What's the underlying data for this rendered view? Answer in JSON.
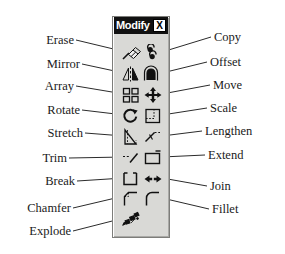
{
  "panel": {
    "title": "Modify",
    "close_label": "X",
    "background_color": "#d9d9d6",
    "titlebar_color": "#111111"
  },
  "tools": [
    {
      "row": 0,
      "col": "left",
      "label": "Erase",
      "icon": "eraser-icon"
    },
    {
      "row": 0,
      "col": "right",
      "label": "Copy",
      "icon": "copy-icon"
    },
    {
      "row": 1,
      "col": "left",
      "label": "Mirror",
      "icon": "mirror-icon"
    },
    {
      "row": 1,
      "col": "right",
      "label": "Offset",
      "icon": "offset-icon"
    },
    {
      "row": 2,
      "col": "left",
      "label": "Array",
      "icon": "array-icon"
    },
    {
      "row": 2,
      "col": "right",
      "label": "Move",
      "icon": "move-icon"
    },
    {
      "row": 3,
      "col": "left",
      "label": "Rotate",
      "icon": "rotate-icon"
    },
    {
      "row": 3,
      "col": "right",
      "label": "Scale",
      "icon": "scale-icon"
    },
    {
      "row": 4,
      "col": "left",
      "label": "Stretch",
      "icon": "stretch-icon"
    },
    {
      "row": 4,
      "col": "right",
      "label": "Lengthen",
      "icon": "lengthen-icon"
    },
    {
      "row": 5,
      "col": "left",
      "label": "Trim",
      "icon": "trim-icon"
    },
    {
      "row": 5,
      "col": "right",
      "label": "Extend",
      "icon": "extend-icon"
    },
    {
      "row": 6,
      "col": "left",
      "label": "Break",
      "icon": "break-icon"
    },
    {
      "row": 6,
      "col": "right",
      "label": "Join",
      "icon": "join-icon"
    },
    {
      "row": 7,
      "col": "left",
      "label": "Chamfer",
      "icon": "chamfer-icon"
    },
    {
      "row": 7,
      "col": "right",
      "label": "Fillet",
      "icon": "fillet-icon"
    },
    {
      "row": 8,
      "col": "left",
      "label": "Explode",
      "icon": "explode-icon"
    }
  ],
  "labels_left": [
    "Erase",
    "Mirror",
    "Array",
    "Rotate",
    "Stretch",
    "Trim",
    "Break",
    "Chamfer",
    "Explode"
  ],
  "labels_right": [
    "Copy",
    "Offset",
    "Move",
    "Scale",
    "Lengthen",
    "Extend",
    "Join",
    "Fillet"
  ]
}
